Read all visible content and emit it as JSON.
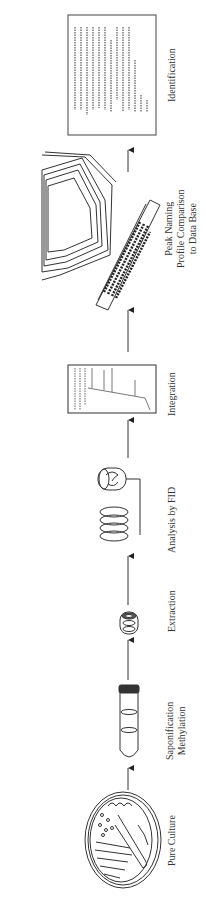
{
  "diagram": {
    "title": "",
    "orientation": "rotated -90deg; flow from bottom to top",
    "colors": {
      "line": "#333333",
      "background": "#ffffff",
      "text": "#333333"
    },
    "steps": [
      {
        "id": "pure-culture",
        "label_lines": [
          "Pure Culture"
        ],
        "icon": "petri-dish-icon"
      },
      {
        "id": "saponification",
        "label_lines": [
          "Saponification",
          "Methylation"
        ],
        "icon": "test-tube-icon"
      },
      {
        "id": "extraction",
        "label_lines": [
          "Extraction"
        ],
        "icon": "vial-icon"
      },
      {
        "id": "analysis",
        "label_lines": [
          "Analysis by FID"
        ],
        "icon": "gc-column-fid-icon"
      },
      {
        "id": "integration",
        "label_lines": [
          "Integration"
        ],
        "icon": "chromatogram-printout-icon"
      },
      {
        "id": "peak-naming",
        "label_lines": [
          "Peak Naming",
          "Profile Comparison",
          "to Data Base"
        ],
        "icon": "computer-terminal-icon"
      },
      {
        "id": "identification",
        "label_lines": [
          "Identification"
        ],
        "icon": "report-printout-icon"
      }
    ],
    "connectors": 6
  }
}
